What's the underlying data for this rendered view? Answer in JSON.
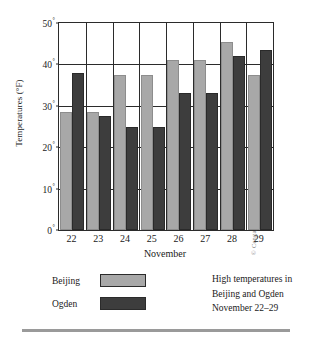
{
  "chart_data": {
    "type": "bar",
    "xlabel": "November",
    "ylabel": "Temperatures (°F)",
    "categories": [
      "22",
      "23",
      "24",
      "25",
      "26",
      "27",
      "28",
      "29"
    ],
    "series": [
      {
        "name": "Beijing",
        "color": "#a8a8a8",
        "values": [
          28.5,
          28.5,
          37.5,
          37.5,
          41,
          41,
          45.5,
          37.5
        ]
      },
      {
        "name": "Ogden",
        "color": "#3d3d3d",
        "values": [
          38,
          27.5,
          25,
          25,
          33,
          33,
          42,
          43.5
        ]
      }
    ],
    "ylim": [
      0,
      50
    ],
    "yticks": [
      0,
      10,
      20,
      30,
      40,
      50
    ],
    "ytick_labels": [
      "0",
      "10",
      "20",
      "30",
      "40",
      "50"
    ],
    "ytick_suffix": "°",
    "grid": true,
    "legend_position": "below"
  },
  "axes": {
    "y_title": "Temperatures (°F)",
    "x_title": "November"
  },
  "legend": {
    "rows": [
      {
        "label": "Beijing",
        "swatch": "light"
      },
      {
        "label": "Ogden",
        "swatch": "dark"
      }
    ],
    "caption_lines": [
      "High temperatures in",
      "Beijing and Ogden",
      "November 22–29"
    ]
  },
  "credit": "© Cengage Learning"
}
